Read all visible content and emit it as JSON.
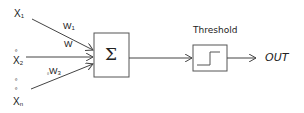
{
  "diagram": {
    "type": "perceptron",
    "inputs": [
      {
        "label": "X",
        "sub": "1"
      },
      {
        "label": "X",
        "sub": "2"
      },
      {
        "label": "X",
        "sub": "n"
      }
    ],
    "ellipsis_marks": [
      "º",
      "º",
      "º"
    ],
    "weights": [
      {
        "label": "W",
        "sub": "1"
      },
      {
        "label": "W",
        "sub": ""
      },
      {
        "prefix": "₀",
        "label": "W",
        "sub": "3"
      }
    ],
    "summation": {
      "symbol": "Σ"
    },
    "threshold": {
      "title": "Threshold"
    },
    "output": {
      "label": "OUT"
    },
    "colors": {
      "line": "#444444",
      "box": "#555555",
      "text": "#222222"
    }
  }
}
